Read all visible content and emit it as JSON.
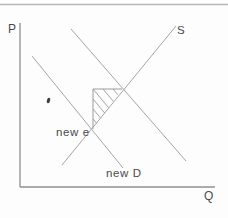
{
  "figure": {
    "type": "supply-demand-diagram",
    "background": "#fdfdfd",
    "colors": {
      "top_rule": "#b6b6b6",
      "axis": "#8f8f8f",
      "curve": "#a5a5a5",
      "triangle": "#9b9b9b",
      "text": "#4a4a4a",
      "mark": "#3d3d3d"
    },
    "top_rule": {
      "x1": 0,
      "y1": 4.5,
      "x2": 228,
      "y2": 4.5
    },
    "axes": {
      "y_axis": {
        "label": "P",
        "x1": 20,
        "y1": 23,
        "x2": 20,
        "y2": 187,
        "label_x": 8,
        "label_y": 33
      },
      "x_axis": {
        "label": "Q",
        "x1": 20,
        "y1": 187,
        "x2": 215,
        "y2": 187,
        "label_x": 204,
        "label_y": 200
      }
    },
    "curves": [
      {
        "name": "supply-line",
        "label": "S",
        "x1": 62,
        "y1": 165,
        "x2": 176,
        "y2": 26,
        "label_x": 177,
        "label_y": 34
      },
      {
        "name": "old-demand-line",
        "label": "",
        "x1": 71,
        "y1": 29,
        "x2": 186,
        "y2": 161,
        "label_x": null,
        "label_y": null
      },
      {
        "name": "new-demand-line",
        "label": "new D",
        "x1": 32,
        "y1": 56,
        "x2": 123,
        "y2": 168,
        "label_x": 106,
        "label_y": 177
      }
    ],
    "annotations": [
      {
        "name": "new-equilibrium-label",
        "text": "new e",
        "x": 56,
        "y": 136
      }
    ],
    "welfare_triangle": {
      "outline": [
        [
          93,
          129
        ],
        [
          93,
          89
        ],
        [
          122,
          89
        ]
      ],
      "hatch_lines": [
        [
          113,
          89,
          117.8,
          94.8
        ],
        [
          103,
          89,
          113.2,
          101.2
        ],
        [
          93,
          89,
          108.5,
          107.6
        ],
        [
          93,
          99,
          104.7,
          113.0
        ],
        [
          93,
          109,
          100.8,
          118.3
        ],
        [
          93,
          119,
          96.9,
          123.7
        ]
      ]
    },
    "stray_mark": {
      "cx": 48.5,
      "cy": 100.5,
      "rx": 1.6,
      "ry": 2.8,
      "rotate": 18
    }
  }
}
